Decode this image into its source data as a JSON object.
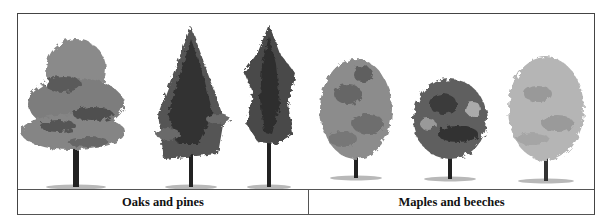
{
  "figure": {
    "groups": [
      {
        "label": "Oaks and pines",
        "trees": [
          {
            "name": "oak-tree",
            "shape": "broad-layered"
          },
          {
            "name": "pine-tree-1",
            "shape": "conical-open"
          },
          {
            "name": "pine-tree-2",
            "shape": "narrow-conical"
          }
        ]
      },
      {
        "label": "Maples and beeches",
        "trees": [
          {
            "name": "maple-tree-1",
            "shape": "oval"
          },
          {
            "name": "beech-tree",
            "shape": "rounded-dense"
          },
          {
            "name": "maple-tree-2",
            "shape": "oval-light"
          }
        ]
      }
    ],
    "colors": {
      "border": "#555555",
      "foliage_dark": "#3a3a3a",
      "foliage_mid": "#7a7a7a",
      "foliage_light": "#b5b5b5",
      "trunk": "#222222"
    }
  }
}
